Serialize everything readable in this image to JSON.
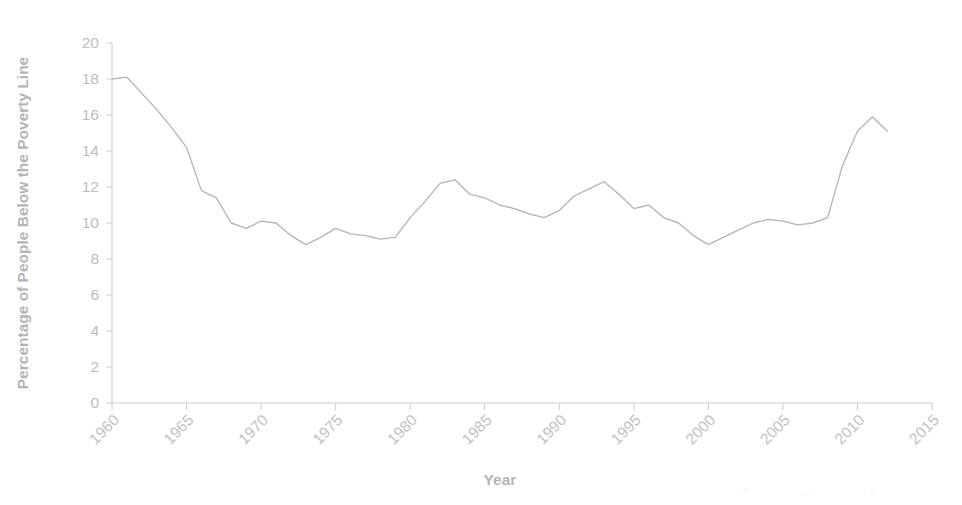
{
  "chart_data": {
    "type": "line",
    "title": "",
    "xlabel": "Year",
    "ylabel": "Percentage of People Below the Poverty Line",
    "xlim": [
      1960,
      2015
    ],
    "ylim": [
      0,
      20
    ],
    "grid": false,
    "legend": null,
    "x_ticks": [
      "1960",
      "1965",
      "1970",
      "1975",
      "1980",
      "1985",
      "1990",
      "1995",
      "2000",
      "2005",
      "2010",
      "2015"
    ],
    "x_tick_values": [
      1960,
      1965,
      1970,
      1975,
      1980,
      1985,
      1990,
      1995,
      2000,
      2005,
      2010,
      2015
    ],
    "y_ticks": [
      "0",
      "2",
      "4",
      "6",
      "8",
      "10",
      "12",
      "14",
      "16",
      "18",
      "20"
    ],
    "y_tick_values": [
      0,
      2,
      4,
      6,
      8,
      10,
      12,
      14,
      16,
      18,
      20
    ],
    "x_tick_rotation": 45,
    "line_color": "#b5b5b5",
    "axis_color": "#cfcfcf",
    "text_color": "#bdbdbd",
    "series": [
      {
        "name": "Percentage of People Below the Poverty Line",
        "x": [
          1960,
          1961,
          1962,
          1963,
          1964,
          1965,
          1966,
          1967,
          1968,
          1969,
          1970,
          1971,
          1972,
          1973,
          1974,
          1975,
          1976,
          1977,
          1978,
          1979,
          1980,
          1981,
          1982,
          1983,
          1984,
          1985,
          1986,
          1987,
          1988,
          1989,
          1990,
          1991,
          1992,
          1993,
          1994,
          1995,
          1996,
          1997,
          1998,
          1999,
          2000,
          2001,
          2002,
          2003,
          2004,
          2005,
          2006,
          2007,
          2008,
          2009,
          2010,
          2011,
          2012
        ],
        "values": [
          18.0,
          18.1,
          17.2,
          16.3,
          15.3,
          14.2,
          11.8,
          11.4,
          10.0,
          9.7,
          10.1,
          10.0,
          9.3,
          8.8,
          9.2,
          9.7,
          9.4,
          9.3,
          9.1,
          9.2,
          10.3,
          11.2,
          12.2,
          12.4,
          11.6,
          11.4,
          11.0,
          10.8,
          10.5,
          10.3,
          10.7,
          11.5,
          11.9,
          12.3,
          11.6,
          10.8,
          11.0,
          10.3,
          10.0,
          9.3,
          8.8,
          9.2,
          9.6,
          10.0,
          10.2,
          10.1,
          9.9,
          10.0,
          10.3,
          13.2,
          15.1,
          15.9,
          15.1
        ]
      }
    ]
  },
  "axis": {
    "x_title": "Year",
    "y_title": "Percentage of People Below the Poverty Line"
  }
}
